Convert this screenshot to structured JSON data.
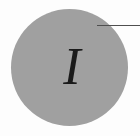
{
  "figure": {
    "type": "decorative-initial",
    "initial_letter": "I",
    "background_color": "#fdfdfd",
    "disc": {
      "shape": "circle",
      "color": "#a0a0a0",
      "diameter_px": 117,
      "center_x_px": 69,
      "center_y_px": 67
    },
    "letter": {
      "glyph": "I",
      "color": "#1a1a1a",
      "style": "serif-italic",
      "size_px": 52
    },
    "rule": {
      "orientation": "horizontal",
      "color": "#4f4f4f",
      "thickness_px": 1,
      "start_x_px": 97,
      "y_px": 25
    }
  }
}
